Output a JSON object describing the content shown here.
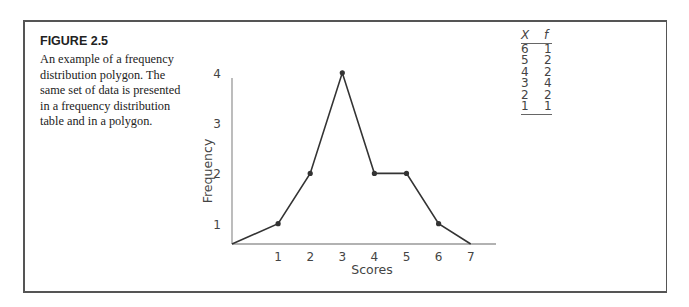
{
  "figure": {
    "label": "FIGURE 2.5",
    "caption": "An example of a frequency distribution polygon. The same set of data is presented in a frequency distribution table and in a polygon."
  },
  "table": {
    "headers": [
      "X",
      "f"
    ],
    "rows": [
      [
        "6",
        "1"
      ],
      [
        "5",
        "2"
      ],
      [
        "4",
        "2"
      ],
      [
        "3",
        "4"
      ],
      [
        "2",
        "2"
      ],
      [
        "1",
        "1"
      ]
    ]
  },
  "chart_data": {
    "type": "line",
    "title": "",
    "xlabel": "Scores",
    "ylabel": "Frequency",
    "x": [
      0,
      1,
      2,
      3,
      4,
      5,
      6,
      7
    ],
    "values": [
      0,
      1,
      2,
      4,
      2,
      2,
      1,
      0
    ],
    "markers_at": [
      1,
      2,
      3,
      4,
      5,
      6
    ],
    "x_ticks": [
      "1",
      "2",
      "3",
      "4",
      "5",
      "6",
      "7"
    ],
    "y_ticks": [
      "1",
      "2",
      "3",
      "4"
    ],
    "xlim": [
      0,
      7.5
    ],
    "ylim": [
      0,
      4.5
    ],
    "grid": false,
    "legend": null
  }
}
